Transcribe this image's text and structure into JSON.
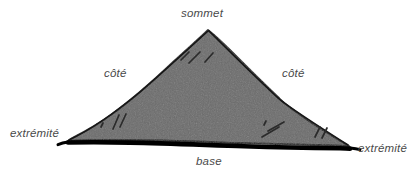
{
  "figure": {
    "type": "geometry-diagram",
    "language": "fr",
    "style": "hand-drawn sketch, grey fill, black outline, thick base stroke",
    "colors": {
      "background": "#ffffff",
      "fill": "#6b6b6b",
      "outline": "#1a1a1a",
      "base_stroke": "#000000",
      "label_text": "#4a4a4a",
      "hatch": "#2b2b2b"
    },
    "labels": {
      "apex": "sommet",
      "side_left": "côté",
      "side_right": "côté",
      "end_left": "extrémité",
      "end_right": "extrémité",
      "base": "base"
    },
    "vertices": {
      "apex": [
        208,
        30
      ],
      "end_left": [
        68,
        141
      ],
      "end_right": [
        349,
        146
      ]
    },
    "hatch_marks": [
      {
        "x1": 181,
        "y1": 60,
        "x2": 189,
        "y2": 52
      },
      {
        "x1": 189,
        "y1": 63,
        "x2": 200,
        "y2": 52
      },
      {
        "x1": 205,
        "y1": 62,
        "x2": 213,
        "y2": 53
      },
      {
        "x1": 101,
        "y1": 127,
        "x2": 103,
        "y2": 123
      },
      {
        "x1": 113,
        "y1": 129,
        "x2": 119,
        "y2": 115
      },
      {
        "x1": 120,
        "y1": 127,
        "x2": 126,
        "y2": 114
      },
      {
        "x1": 264,
        "y1": 125,
        "x2": 266,
        "y2": 121
      },
      {
        "x1": 268,
        "y1": 131,
        "x2": 284,
        "y2": 122
      },
      {
        "x1": 262,
        "y1": 137,
        "x2": 279,
        "y2": 127
      },
      {
        "x1": 315,
        "y1": 137,
        "x2": 320,
        "y2": 127
      },
      {
        "x1": 322,
        "y1": 138,
        "x2": 327,
        "y2": 128
      }
    ]
  }
}
